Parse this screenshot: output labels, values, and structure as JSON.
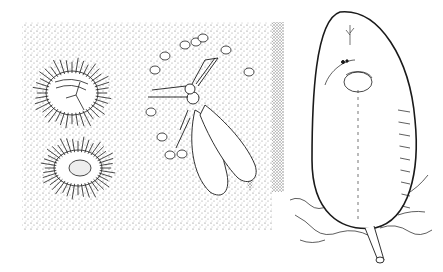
{
  "figure": {
    "kind": "scientific line illustration",
    "panels": [
      {
        "id": "left",
        "subject": "two fuzzy scale-insect nymphs, winged adult male insect and small eggs on a stippled leaf surface"
      },
      {
        "id": "right",
        "subject": "large oval scale-insect body attached to plant tissue by a short stalk"
      }
    ],
    "colors": {
      "ink": "#1a1a1a",
      "paper": "#ffffff",
      "stipple": "#444444"
    }
  }
}
